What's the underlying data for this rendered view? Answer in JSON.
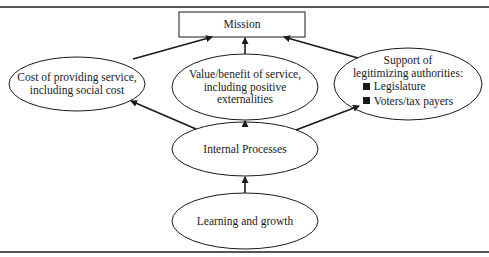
{
  "diagram": {
    "type": "flow-hierarchy",
    "nodes": {
      "mission": {
        "label": "Mission",
        "shape": "rectangle"
      },
      "cost": {
        "lines": [
          "Cost of providing service,",
          "including social cost"
        ],
        "shape": "ellipse"
      },
      "value": {
        "lines": [
          "Value/benefit of service,",
          "including positive",
          "externalities"
        ],
        "shape": "ellipse"
      },
      "support": {
        "lines": [
          "Support of",
          "legitimizing authorities:"
        ],
        "bullets": [
          "Legislature",
          "Voters/tax payers"
        ],
        "shape": "ellipse"
      },
      "internal": {
        "label": "Internal Processes",
        "shape": "ellipse"
      },
      "learning": {
        "label": "Learning and growth",
        "shape": "ellipse"
      }
    },
    "edges": [
      {
        "from": "cost",
        "to": "mission"
      },
      {
        "from": "value",
        "to": "mission"
      },
      {
        "from": "support",
        "to": "mission"
      },
      {
        "from": "internal",
        "to": "cost"
      },
      {
        "from": "internal",
        "to": "value"
      },
      {
        "from": "internal",
        "to": "support"
      },
      {
        "from": "learning",
        "to": "internal"
      }
    ],
    "colors": {
      "stroke": "#1a1a1a",
      "background": "#ffffff",
      "rule": "#555555"
    }
  }
}
